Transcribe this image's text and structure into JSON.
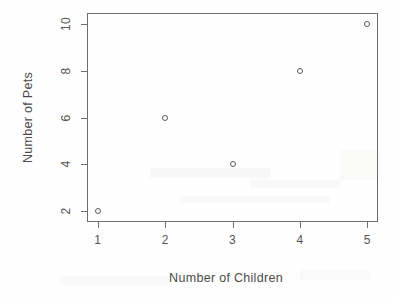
{
  "chart_data": {
    "type": "scatter",
    "title": "",
    "xlabel": "Number of Children",
    "ylabel": "Number of Pets",
    "x": [
      1,
      2,
      3,
      4,
      5
    ],
    "y": [
      2,
      6,
      4,
      8,
      10
    ],
    "points": [
      {
        "x": 1,
        "y": 2
      },
      {
        "x": 2,
        "y": 6
      },
      {
        "x": 3,
        "y": 4
      },
      {
        "x": 4,
        "y": 8
      },
      {
        "x": 5,
        "y": 10
      }
    ],
    "xticks": [
      "1",
      "2",
      "3",
      "4",
      "5"
    ],
    "yticks": [
      "2",
      "4",
      "6",
      "8",
      "10"
    ],
    "xtick_values": [
      1,
      2,
      3,
      4,
      5
    ],
    "ytick_values": [
      2,
      4,
      6,
      8,
      10
    ],
    "xlim": [
      0.84,
      5.16
    ],
    "ylim": [
      1.55,
      10.45
    ],
    "grid": false,
    "legend": null,
    "marker": "open-circle",
    "marker_color": "#5c5c5c",
    "axis_color": "#6e6e6e",
    "background": "#fefefe"
  }
}
